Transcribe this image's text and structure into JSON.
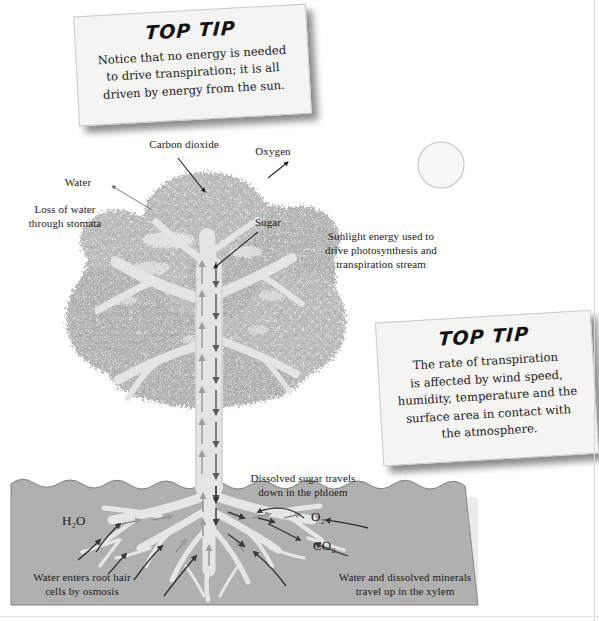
{
  "tips": [
    {
      "heading": "TOP TIP",
      "body": "Notice that no energy is needed\nto drive transpiration; it is all\ndriven by energy from the sun."
    },
    {
      "heading": "TOP TIP",
      "body": "The rate of transpiration\nis affected by wind speed,\nhumidity, temperature and the\nsurface area in contact with\nthe atmosphere."
    }
  ],
  "labels": {
    "carbon_dioxide": "Carbon dioxide",
    "oxygen": "Oxygen",
    "water": "Water",
    "loss_of_water": "Loss of water\nthrough stomata",
    "sugar": "Sugar",
    "sunlight": "Sunlight energy used to\ndrive photosynthesis and\ntranspiration stream",
    "dissolved_sugar": "Dissolved sugar travels\ndown in the phloem",
    "h2o": "H₂O",
    "o2": "O₂",
    "co2": "CO₂",
    "root_hair": "Water enters root hair\ncells by osmosis",
    "xylem": "Water and dissolved minerals\ntravel up in the xylem"
  },
  "icons": {
    "sun": "sun-icon",
    "tree": "tree-icon",
    "soil": "soil-block-icon",
    "up_arrows": "xylem-up-arrow-icon",
    "down_arrows": "phloem-down-arrow-icon"
  },
  "colors": {
    "canopy": "#b6b6b6",
    "canopy_light": "#d5d5d5",
    "trunk": "#e3e3e3",
    "trunk_edge": "#c9c9c9",
    "soil": "#b0b0b0",
    "soil_edge": "#8a8a8a",
    "root": "#e6e6e6",
    "arrow_dark": "#5a5a5a",
    "arrow_light": "#9a9a9a",
    "leader_line": "#2b2b2b",
    "paper": "#f4f4f2",
    "text": "#1b1b1b"
  }
}
